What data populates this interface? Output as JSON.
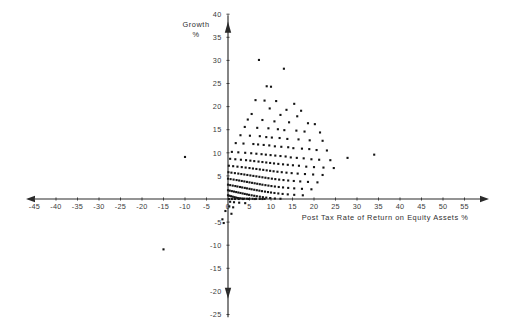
{
  "chart_data": {
    "type": "scatter",
    "title": "",
    "xlabel": "Post Tax Rate of Return on Equity Assets %",
    "ylabel": "Growth %",
    "ylabel_line1": "Growth",
    "ylabel_line2": "%",
    "xlim": [
      -47,
      57
    ],
    "ylim": [
      -26,
      41
    ],
    "grid": false,
    "legend": null,
    "xticks": [
      -45,
      -40,
      -35,
      -30,
      -25,
      -20,
      -15,
      -10,
      -5,
      0,
      5,
      10,
      15,
      20,
      25,
      30,
      35,
      40,
      45,
      50,
      55
    ],
    "xticklabels": [
      "-45",
      "-40",
      "-35",
      "-30",
      "-25",
      "-20",
      "-15",
      "-10",
      "-5",
      "0",
      "5",
      "10",
      "15",
      "20",
      "25",
      "30",
      "35",
      "40",
      "45",
      "50",
      "55"
    ],
    "yticks": [
      -25,
      -20,
      -15,
      -10,
      -5,
      5,
      10,
      15,
      20,
      25,
      30,
      35,
      40
    ],
    "yticklabels": [
      "-25",
      "-20",
      "-15",
      "-10",
      "-5",
      "5",
      "10",
      "15",
      "20",
      "25",
      "30",
      "35",
      "40"
    ],
    "point_color": "#151515",
    "axis_color": "#2a2a2a",
    "marker": "square",
    "marker_size": 2.1,
    "n_points": 232,
    "points": [
      [
        7.2,
        30.1
      ],
      [
        13.0,
        28.2
      ],
      [
        9.0,
        24.4
      ],
      [
        10.0,
        24.3
      ],
      [
        6.4,
        21.4
      ],
      [
        8.5,
        21.3
      ],
      [
        11.2,
        21.2
      ],
      [
        15.4,
        20.6
      ],
      [
        9.7,
        19.6
      ],
      [
        13.6,
        19.3
      ],
      [
        17.0,
        19.1
      ],
      [
        5.5,
        18.4
      ],
      [
        12.2,
        18.2
      ],
      [
        16.1,
        17.9
      ],
      [
        4.6,
        17.2
      ],
      [
        8.0,
        17.1
      ],
      [
        10.8,
        16.8
      ],
      [
        14.2,
        16.6
      ],
      [
        18.6,
        16.4
      ],
      [
        20.2,
        16.2
      ],
      [
        3.9,
        15.6
      ],
      [
        6.8,
        15.4
      ],
      [
        9.4,
        15.3
      ],
      [
        11.6,
        15.1
      ],
      [
        13.1,
        14.9
      ],
      [
        15.9,
        14.8
      ],
      [
        17.8,
        14.6
      ],
      [
        21.4,
        14.4
      ],
      [
        2.9,
        13.8
      ],
      [
        5.1,
        13.7
      ],
      [
        7.4,
        13.6
      ],
      [
        8.9,
        13.4
      ],
      [
        10.2,
        13.3
      ],
      [
        12.0,
        13.2
      ],
      [
        13.8,
        13.0
      ],
      [
        16.4,
        12.9
      ],
      [
        19.0,
        12.7
      ],
      [
        22.0,
        12.6
      ],
      [
        1.8,
        12.1
      ],
      [
        3.6,
        12.0
      ],
      [
        5.9,
        11.9
      ],
      [
        7.0,
        11.8
      ],
      [
        8.3,
        11.7
      ],
      [
        9.6,
        11.6
      ],
      [
        10.9,
        11.4
      ],
      [
        12.4,
        11.3
      ],
      [
        14.0,
        11.2
      ],
      [
        15.2,
        11.0
      ],
      [
        17.2,
        10.9
      ],
      [
        18.9,
        10.8
      ],
      [
        20.6,
        10.6
      ],
      [
        23.0,
        10.5
      ],
      [
        -10.0,
        9.1
      ],
      [
        0.9,
        10.2
      ],
      [
        2.4,
        10.1
      ],
      [
        4.0,
        10.0
      ],
      [
        5.4,
        9.9
      ],
      [
        6.6,
        9.8
      ],
      [
        7.8,
        9.7
      ],
      [
        8.8,
        9.6
      ],
      [
        9.9,
        9.5
      ],
      [
        11.0,
        9.4
      ],
      [
        12.2,
        9.3
      ],
      [
        13.4,
        9.2
      ],
      [
        14.6,
        9.0
      ],
      [
        16.0,
        8.9
      ],
      [
        17.6,
        8.8
      ],
      [
        19.4,
        8.6
      ],
      [
        21.2,
        8.5
      ],
      [
        23.8,
        8.4
      ],
      [
        27.8,
        8.9
      ],
      [
        34.0,
        9.6
      ],
      [
        0.5,
        8.7
      ],
      [
        1.7,
        8.6
      ],
      [
        3.0,
        8.5
      ],
      [
        4.2,
        8.4
      ],
      [
        5.2,
        8.3
      ],
      [
        6.1,
        8.2
      ],
      [
        7.1,
        8.1
      ],
      [
        8.0,
        8.0
      ],
      [
        8.9,
        7.9
      ],
      [
        9.8,
        7.8
      ],
      [
        10.7,
        7.7
      ],
      [
        11.7,
        7.6
      ],
      [
        12.8,
        7.5
      ],
      [
        13.9,
        7.4
      ],
      [
        15.1,
        7.3
      ],
      [
        16.5,
        7.2
      ],
      [
        18.2,
        7.0
      ],
      [
        20.0,
        6.9
      ],
      [
        22.2,
        6.8
      ],
      [
        24.6,
        6.7
      ],
      [
        0.2,
        7.2
      ],
      [
        1.2,
        7.1
      ],
      [
        2.2,
        7.0
      ],
      [
        3.2,
        6.9
      ],
      [
        4.1,
        6.8
      ],
      [
        5.0,
        6.7
      ],
      [
        5.8,
        6.6
      ],
      [
        6.6,
        6.5
      ],
      [
        7.4,
        6.4
      ],
      [
        8.2,
        6.3
      ],
      [
        9.0,
        6.2
      ],
      [
        9.8,
        6.1
      ],
      [
        10.6,
        6.0
      ],
      [
        11.5,
        5.9
      ],
      [
        12.5,
        5.8
      ],
      [
        13.6,
        5.7
      ],
      [
        14.8,
        5.6
      ],
      [
        16.2,
        5.5
      ],
      [
        17.9,
        5.4
      ],
      [
        19.8,
        5.3
      ],
      [
        22.0,
        5.2
      ],
      [
        0.1,
        5.8
      ],
      [
        0.8,
        5.7
      ],
      [
        1.6,
        5.6
      ],
      [
        2.4,
        5.5
      ],
      [
        3.1,
        5.4
      ],
      [
        3.8,
        5.3
      ],
      [
        4.5,
        5.2
      ],
      [
        5.2,
        5.1
      ],
      [
        5.9,
        5.0
      ],
      [
        6.6,
        4.9
      ],
      [
        7.3,
        4.8
      ],
      [
        8.0,
        4.7
      ],
      [
        8.7,
        4.6
      ],
      [
        9.4,
        4.5
      ],
      [
        10.2,
        4.4
      ],
      [
        11.0,
        4.3
      ],
      [
        11.9,
        4.2
      ],
      [
        12.9,
        4.1
      ],
      [
        14.0,
        4.0
      ],
      [
        15.3,
        3.9
      ],
      [
        16.8,
        3.8
      ],
      [
        18.6,
        3.7
      ],
      [
        20.8,
        3.6
      ],
      [
        0.0,
        4.4
      ],
      [
        0.6,
        4.3
      ],
      [
        1.3,
        4.2
      ],
      [
        2.0,
        4.1
      ],
      [
        2.6,
        4.0
      ],
      [
        3.2,
        3.9
      ],
      [
        3.8,
        3.8
      ],
      [
        4.4,
        3.7
      ],
      [
        5.0,
        3.6
      ],
      [
        5.6,
        3.5
      ],
      [
        6.2,
        3.4
      ],
      [
        6.8,
        3.3
      ],
      [
        7.4,
        3.2
      ],
      [
        8.0,
        3.1
      ],
      [
        8.7,
        3.0
      ],
      [
        9.4,
        2.9
      ],
      [
        10.1,
        2.8
      ],
      [
        10.9,
        2.7
      ],
      [
        11.8,
        2.6
      ],
      [
        12.8,
        2.5
      ],
      [
        14.0,
        2.4
      ],
      [
        15.4,
        2.3
      ],
      [
        17.2,
        2.2
      ],
      [
        19.4,
        2.1
      ],
      [
        0.0,
        3.1
      ],
      [
        0.5,
        3.0
      ],
      [
        1.1,
        2.9
      ],
      [
        1.7,
        2.8
      ],
      [
        2.2,
        2.7
      ],
      [
        2.8,
        2.6
      ],
      [
        3.3,
        2.5
      ],
      [
        3.9,
        2.4
      ],
      [
        4.4,
        2.3
      ],
      [
        5.0,
        2.2
      ],
      [
        5.5,
        2.1
      ],
      [
        6.1,
        2.0
      ],
      [
        6.7,
        1.9
      ],
      [
        7.3,
        1.8
      ],
      [
        7.9,
        1.7
      ],
      [
        8.6,
        1.6
      ],
      [
        9.3,
        1.5
      ],
      [
        10.0,
        1.4
      ],
      [
        10.8,
        1.3
      ],
      [
        11.7,
        1.2
      ],
      [
        12.7,
        1.1
      ],
      [
        13.9,
        1.0
      ],
      [
        15.4,
        0.9
      ],
      [
        17.4,
        0.8
      ],
      [
        0.0,
        1.9
      ],
      [
        0.4,
        1.8
      ],
      [
        0.9,
        1.7
      ],
      [
        1.4,
        1.6
      ],
      [
        1.9,
        1.5
      ],
      [
        2.4,
        1.4
      ],
      [
        2.9,
        1.3
      ],
      [
        3.4,
        1.2
      ],
      [
        3.9,
        1.1
      ],
      [
        4.4,
        1.0
      ],
      [
        4.9,
        0.9
      ],
      [
        5.5,
        0.8
      ],
      [
        6.1,
        0.7
      ],
      [
        6.7,
        0.6
      ],
      [
        7.4,
        0.5
      ],
      [
        8.1,
        0.4
      ],
      [
        8.9,
        0.3
      ],
      [
        9.8,
        0.2
      ],
      [
        10.9,
        0.1
      ],
      [
        12.2,
        0.05
      ],
      [
        0.0,
        0.8
      ],
      [
        0.3,
        0.7
      ],
      [
        0.7,
        0.6
      ],
      [
        1.1,
        0.5
      ],
      [
        1.5,
        0.4
      ],
      [
        1.9,
        0.3
      ],
      [
        2.3,
        0.2
      ],
      [
        2.8,
        0.15
      ],
      [
        3.3,
        0.1
      ],
      [
        3.8,
        0.08
      ],
      [
        4.4,
        0.06
      ],
      [
        5.0,
        0.05
      ],
      [
        5.7,
        0.04
      ],
      [
        6.5,
        0.03
      ],
      [
        7.4,
        0.02
      ],
      [
        8.5,
        0.02
      ],
      [
        0.2,
        0.0
      ],
      [
        0.9,
        0.0
      ],
      [
        1.6,
        0.0
      ],
      [
        2.5,
        0.0
      ],
      [
        3.5,
        0.0
      ],
      [
        4.8,
        0.0
      ],
      [
        6.2,
        0.0
      ],
      [
        8.0,
        0.0
      ],
      [
        0.5,
        -0.6
      ],
      [
        1.4,
        -0.7
      ],
      [
        2.6,
        -0.8
      ],
      [
        4.0,
        -0.9
      ],
      [
        0.3,
        -1.6
      ],
      [
        1.2,
        -1.8
      ],
      [
        -0.6,
        -2.6
      ],
      [
        0.8,
        -3.2
      ],
      [
        -1.3,
        -4.4
      ],
      [
        -1.0,
        -5.2
      ],
      [
        -15.0,
        -10.9
      ]
    ]
  },
  "axes": {
    "x_title": "Post Tax Rate of Return on Equity Assets %",
    "y_title_top": "Growth",
    "y_title_bottom": "%"
  }
}
